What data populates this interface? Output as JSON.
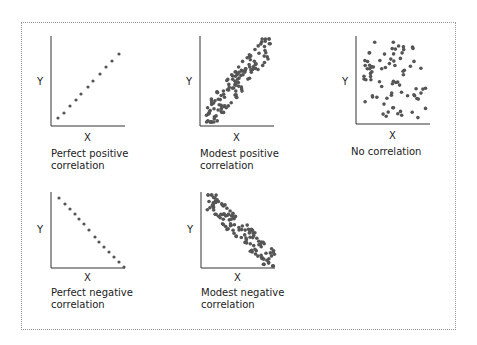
{
  "panels": [
    {
      "id": "perfect-positive",
      "caption": "Perfect positive\ncorrelation",
      "xlabel": "X",
      "ylabel": "Y"
    },
    {
      "id": "modest-positive",
      "caption": "Modest positive\ncorrelation",
      "xlabel": "X",
      "ylabel": "Y"
    },
    {
      "id": "no-correlation",
      "caption": "No correlation",
      "xlabel": "X",
      "ylabel": "Y"
    },
    {
      "id": "perfect-negative",
      "caption": "Perfect negative\ncorrelation",
      "xlabel": "X",
      "ylabel": "Y"
    },
    {
      "id": "modest-negative",
      "caption": "Modest negative\ncorrelation",
      "xlabel": "X",
      "ylabel": "Y"
    }
  ],
  "colors": {
    "axis": "#333333",
    "point": "#555555",
    "border": "#9a9a9a"
  }
}
